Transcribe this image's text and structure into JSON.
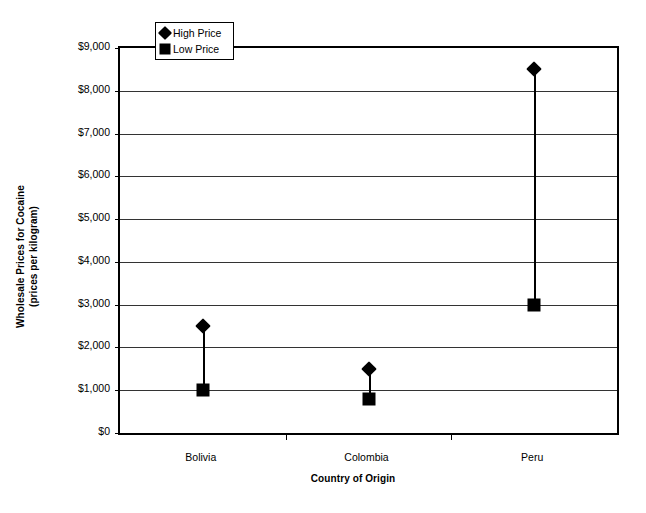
{
  "chart_data": {
    "type": "scatter",
    "title": "",
    "xlabel": "Country of Origin",
    "ylabel": "Wholesale Prices for Cocaine (prices per kilogram)",
    "ylabel_line1": "Wholesale Prices for Cocaine",
    "ylabel_line2": "(prices per kilogram)",
    "categories": [
      "Bolivia",
      "Colombia",
      "Peru"
    ],
    "ylim": [
      0,
      9000
    ],
    "ytick_values": [
      0,
      1000,
      2000,
      3000,
      4000,
      5000,
      6000,
      7000,
      8000,
      9000
    ],
    "ytick_labels": [
      "$0",
      "$1,000",
      "$2,000",
      "$3,000",
      "$4,000",
      "$5,000",
      "$6,000",
      "$7,000",
      "$8,000",
      "$9,000"
    ],
    "grid": true,
    "legend_position": "top-left-inside",
    "series": [
      {
        "name": "High Price",
        "marker": "diamond",
        "color": "#000000",
        "values": [
          2500,
          1500,
          8500
        ]
      },
      {
        "name": "Low Price",
        "marker": "square",
        "color": "#000000",
        "values": [
          1000,
          800,
          3000
        ]
      }
    ]
  },
  "legend": {
    "items": [
      {
        "label": "High Price",
        "marker": "diamond"
      },
      {
        "label": "Low Price",
        "marker": "square"
      }
    ]
  }
}
